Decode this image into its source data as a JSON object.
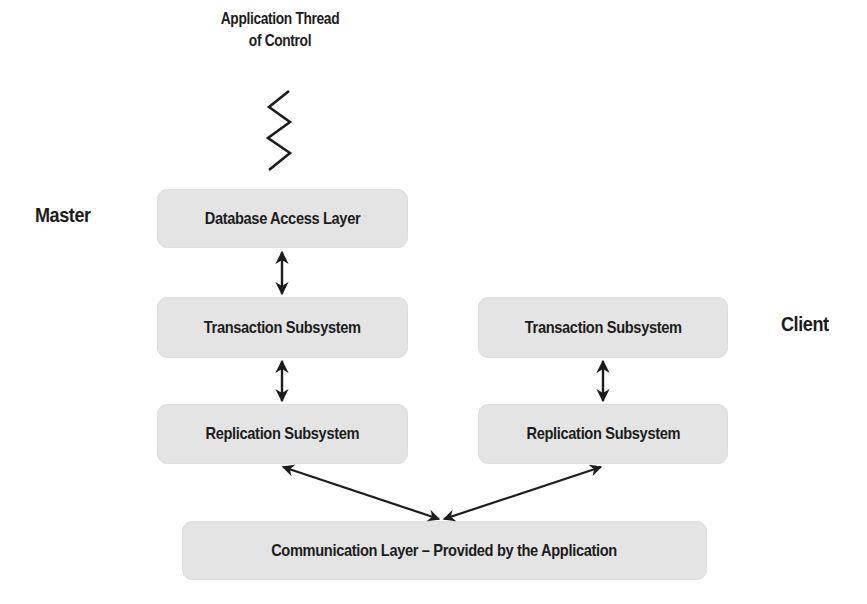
{
  "diagram": {
    "title_line1": "Application Thread",
    "title_line2": "of Control",
    "master_label": "Master",
    "client_label": "Client",
    "master": {
      "database_access_layer": "Database Access Layer",
      "transaction_subsystem": "Transaction Subsystem",
      "replication_subsystem": "Replication Subsystem"
    },
    "client": {
      "transaction_subsystem": "Transaction Subsystem",
      "replication_subsystem": "Replication Subsystem"
    },
    "communication_layer": "Communication Layer – Provided by the Application",
    "icons": {
      "thread": "zigzag-thread-icon",
      "connector": "bidirectional-arrow-icon"
    },
    "colors": {
      "box_fill": "#e4e4e4",
      "text": "#1c1c1c",
      "arrow": "#1c1c1c"
    }
  }
}
